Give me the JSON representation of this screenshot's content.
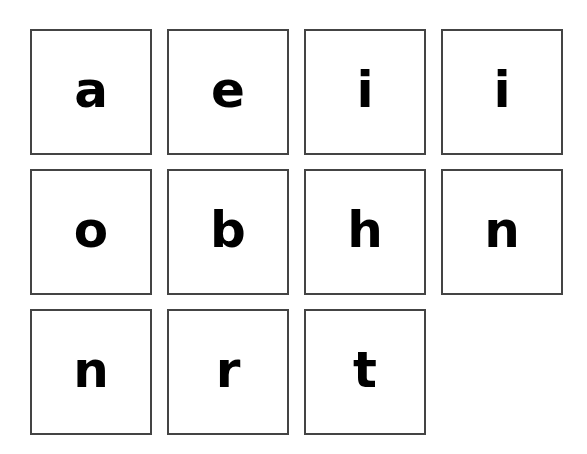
{
  "tiles": [
    {
      "letter": "a"
    },
    {
      "letter": "e"
    },
    {
      "letter": "i"
    },
    {
      "letter": "i"
    },
    {
      "letter": "o"
    },
    {
      "letter": "b"
    },
    {
      "letter": "h"
    },
    {
      "letter": "n"
    },
    {
      "letter": "n"
    },
    {
      "letter": "r"
    },
    {
      "letter": "t"
    }
  ],
  "colors": {
    "background": "#ffffff",
    "tile_border": "#444444",
    "letter": "#000000"
  }
}
